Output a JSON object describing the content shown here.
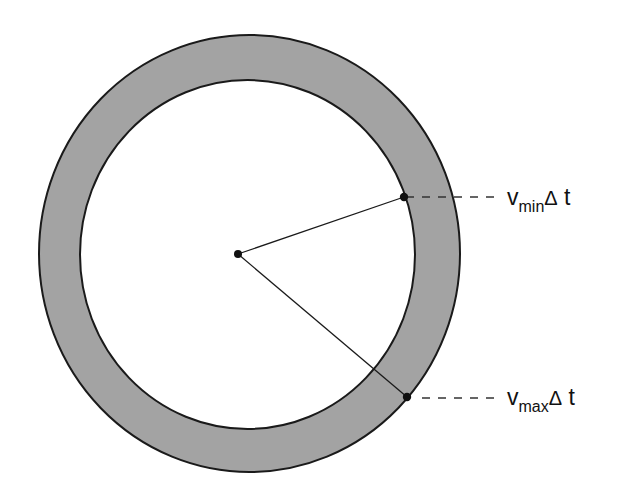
{
  "diagram": {
    "type": "annulus-radius-diagram",
    "colors": {
      "ring_fill": "#a3a3a3",
      "stroke": "#1a1a1a",
      "background": "#ffffff",
      "inner_fill": "#ffffff"
    },
    "outer_ellipse": {
      "cx": 249.5,
      "cy": 253.5,
      "rx": 210.5,
      "ry": 218.5
    },
    "inner_ellipse": {
      "cx": 247.5,
      "cy": 254.5,
      "rx": 167.5,
      "ry": 174.5
    },
    "center_point": {
      "x": 238,
      "y": 254
    },
    "points": [
      {
        "name": "vmin-point",
        "x": 404,
        "y": 197
      },
      {
        "name": "vmax-point",
        "x": 407,
        "y": 397
      }
    ],
    "labels": {
      "vmin": {
        "base": "v",
        "sub": "min",
        "delta": "Δ",
        "var": " t"
      },
      "vmax": {
        "base": "v",
        "sub": "max",
        "delta": "Δ",
        "var": " t"
      }
    }
  }
}
